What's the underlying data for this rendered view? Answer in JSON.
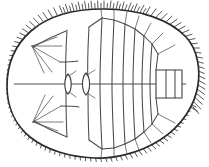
{
  "figure": {
    "title": "Dorsal view line drawing of a fringed segmented arthropod",
    "style": "scientific ink line drawing, no shading",
    "background_color": "#ffffff",
    "ink_color": "#2b2b2b",
    "fine_ink_color": "#5a5a5a",
    "canvas": {
      "width": 209,
      "height": 167
    }
  },
  "anatomy": {
    "body_outline": {
      "label": "body-outline",
      "shape": "broad oval, widest anteriorly, narrowing posteriorly",
      "orientation": "anterior to the left, posterior to the right"
    },
    "marginal_fringe": {
      "label": "marginal-setal-fringe",
      "description": "dense fringe of short fine setae projecting outward around the entire body margin",
      "seta_count": 112
    },
    "head_shield": {
      "label": "head-shield",
      "description": "broad anterior shield with lines radiating from two lateral pivot points"
    },
    "eyes": {
      "label": "paired-lens-structures",
      "count": 2,
      "description": "two small narrow lens-shaped structures flanking the midline at mid-body"
    },
    "midline_axis": {
      "label": "sagittal-midline",
      "description": "continuous horizontal axial line running the length of the body"
    },
    "thoracic_segments": {
      "label": "thoracic-segments",
      "count": 11,
      "description": "transverse segment boundaries curving posteriorly and becoming progressively narrower"
    },
    "telson": {
      "label": "terminal-plate",
      "description": "small rectangular terminal plate divided by two vertical lines at the posterior end"
    }
  },
  "geometry": {
    "outline_path": "M 104 9 C 140 9 170 20 186 37 C 199 51 200 72 198 85 C 195 105 182 126 160 140 C 138 154 112 159 94 158 C 70 157 46 150 30 137 C 14 124 7 105 7 86 C 7 66 14 46 31 31 C 49 15 76 9 104 9 Z",
    "midline": {
      "x1": 14,
      "y1": 84,
      "x2": 186,
      "y2": 84
    },
    "eye_left": {
      "cx": 68,
      "cy": 84,
      "rx": 4.2,
      "ry": 10
    },
    "eye_right": {
      "cx": 86,
      "cy": 84,
      "rx": 4.5,
      "ry": 10.5
    },
    "telson_rect": {
      "x": 156,
      "y": 70,
      "width": 26,
      "height": 28
    },
    "telson_dividers": [
      166,
      175
    ]
  },
  "chart_data": {
    "type": "scatter",
    "xlabel": "",
    "ylabel": "",
    "categories": [
      "head-shield",
      "marginal-setal-fringe",
      "paired-lens-structures",
      "thoracic-segments",
      "terminal-plate"
    ],
    "values": [
      1,
      112,
      2,
      11,
      1
    ],
    "annotations": [
      "anterior at left",
      "posterior at right",
      "bilaterally symmetric about the horizontal midline"
    ],
    "legend_position": "none",
    "grid": false
  }
}
